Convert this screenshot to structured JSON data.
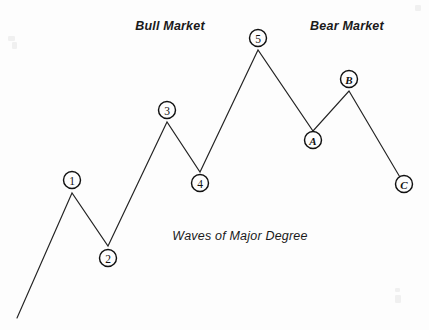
{
  "figure": {
    "caption": "Waves of  Major Degree",
    "background_color": "#fdfdfd",
    "line_color": "#242424",
    "text_color": "#1a1a1a"
  },
  "section_labels": [
    {
      "text": "Bull Market",
      "x": 170,
      "y": 30
    },
    {
      "text": "Bear Market",
      "x": 347,
      "y": 30
    }
  ],
  "chart_data": {
    "type": "line",
    "title": "Waves of  Major Degree",
    "xlabel": "",
    "ylabel": "",
    "grid": false,
    "legend": "none",
    "xlim": [
      0,
      429
    ],
    "ylim": [
      330,
      0
    ],
    "annotations": [
      "Bull Market",
      "Bear Market",
      "Waves of  Major Degree"
    ],
    "series": [
      {
        "name": "Elliott Wave Cycle",
        "points": [
          {
            "label": "",
            "x": 17,
            "y": 318
          },
          {
            "label": "1",
            "x": 72,
            "y": 193
          },
          {
            "label": "2",
            "x": 108,
            "y": 246
          },
          {
            "label": "3",
            "x": 167,
            "y": 122
          },
          {
            "label": "4",
            "x": 200,
            "y": 172
          },
          {
            "label": "5",
            "x": 258,
            "y": 50
          },
          {
            "label": "A",
            "x": 313,
            "y": 131
          },
          {
            "label": "B",
            "x": 349,
            "y": 91
          },
          {
            "label": "C",
            "x": 404,
            "y": 184
          }
        ]
      }
    ]
  },
  "nodes": [
    {
      "label": "1",
      "cx": 72,
      "cy": 180,
      "r": 8.5,
      "kind": "number"
    },
    {
      "label": "2",
      "cx": 108,
      "cy": 258,
      "r": 8.5,
      "kind": "number"
    },
    {
      "label": "3",
      "cx": 167,
      "cy": 110,
      "r": 8.5,
      "kind": "number"
    },
    {
      "label": "4",
      "cx": 200,
      "cy": 183,
      "r": 8.5,
      "kind": "number"
    },
    {
      "label": "5",
      "cx": 258,
      "cy": 38,
      "r": 8.5,
      "kind": "number"
    },
    {
      "label": "A",
      "cx": 313,
      "cy": 140,
      "r": 8.5,
      "kind": "letter"
    },
    {
      "label": "B",
      "cx": 349,
      "cy": 79,
      "r": 8.5,
      "kind": "letter"
    },
    {
      "label": "C",
      "cx": 404,
      "cy": 184,
      "r": 8.5,
      "kind": "letter"
    }
  ],
  "caption": {
    "text": "Waves of  Major Degree",
    "x": 240,
    "y": 240
  }
}
